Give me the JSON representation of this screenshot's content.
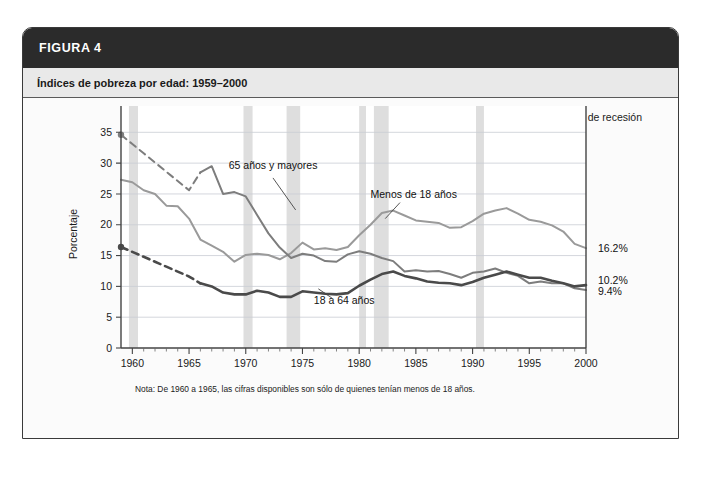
{
  "figure": {
    "header_label": "FIGURA 4",
    "subtitle": "Índices de pobreza por edad: 1959–2000"
  },
  "legend": {
    "recession_label": "Periodo de recesión",
    "swatch_color": "#dedede"
  },
  "note": "Nota: De 1960 a 1965, las cifras disponibles son sólo de quienes tenían menos de 18 años.",
  "end_labels": [
    {
      "name": "menos-de-18",
      "value": "16.2%"
    },
    {
      "name": "18-a-64",
      "value": "10.2%"
    },
    {
      "name": "65-y-mayores",
      "value": "9.4%"
    }
  ],
  "colors": {
    "header_bg": "#2b2b2b",
    "subheader_bg": "#e9e9e9",
    "recession_band": "#dedede",
    "series_menos18": "#9a9a9a",
    "series_18a64": "#4a4a4a",
    "series_65mas": "#7d7d7d",
    "grid": "#c9cdd4"
  },
  "chart_data": {
    "type": "line",
    "title": "Índices de pobreza por edad: 1959–2000",
    "xlabel": "",
    "ylabel": "Porcentaje",
    "xlim": [
      1959,
      2000
    ],
    "ylim": [
      0,
      37
    ],
    "yticks": [
      0,
      5,
      10,
      15,
      20,
      25,
      30,
      35
    ],
    "xticks": [
      1960,
      1965,
      1970,
      1975,
      1980,
      1985,
      1990,
      1995,
      2000
    ],
    "xtick_labels": [
      "1960",
      "1965",
      "1970",
      "1975",
      "1980",
      "1985",
      "1990",
      "1995",
      "2000"
    ],
    "ytick_labels": [
      "0",
      "5",
      "10",
      "15",
      "20",
      "25",
      "30",
      "35"
    ],
    "minor_xtick_step": 1,
    "grid": true,
    "legend_position": "top-right",
    "annotations": [
      {
        "text": "65 años y mayores",
        "x": 1968.5,
        "y": 29.0
      },
      {
        "text": "Menos de 18 años",
        "x": 1981.0,
        "y": 24.4
      },
      {
        "text": "18 a 64 años",
        "x": 1976.0,
        "y": 7.2
      }
    ],
    "recession_bands": [
      {
        "start": 1959.7,
        "end": 1960.5
      },
      {
        "start": 1969.8,
        "end": 1970.6
      },
      {
        "start": 1973.6,
        "end": 1974.8
      },
      {
        "start": 1980.0,
        "end": 1980.6
      },
      {
        "start": 1981.3,
        "end": 1982.6
      },
      {
        "start": 1990.3,
        "end": 1991.0
      }
    ],
    "series": [
      {
        "name": "Menos de 18 años",
        "color": "#9a9a9a",
        "style": "solid",
        "x": [
          1959,
          1960,
          1961,
          1962,
          1963,
          1964,
          1965,
          1966,
          1967,
          1968,
          1969,
          1970,
          1971,
          1972,
          1973,
          1974,
          1975,
          1976,
          1977,
          1978,
          1979,
          1980,
          1981,
          1982,
          1983,
          1984,
          1985,
          1986,
          1987,
          1988,
          1989,
          1990,
          1991,
          1992,
          1993,
          1994,
          1995,
          1996,
          1997,
          1998,
          1999,
          2000
        ],
        "values": [
          27.3,
          26.9,
          25.6,
          25.0,
          23.1,
          23.0,
          21.0,
          17.6,
          16.6,
          15.6,
          14.0,
          15.1,
          15.3,
          15.1,
          14.4,
          15.4,
          17.1,
          16.0,
          16.2,
          15.9,
          16.4,
          18.3,
          20.0,
          21.9,
          22.3,
          21.5,
          20.7,
          20.5,
          20.3,
          19.5,
          19.6,
          20.6,
          21.8,
          22.3,
          22.7,
          21.8,
          20.8,
          20.5,
          19.9,
          18.9,
          16.9,
          16.2
        ]
      },
      {
        "name": "65 años y mayores",
        "color": "#7d7d7d",
        "style": "dashed-then-solid",
        "dashed_until": 1966,
        "x": [
          1959,
          1960,
          1961,
          1962,
          1963,
          1964,
          1965,
          1966,
          1967,
          1968,
          1969,
          1970,
          1971,
          1972,
          1973,
          1974,
          1975,
          1976,
          1977,
          1978,
          1979,
          1980,
          1981,
          1982,
          1983,
          1984,
          1985,
          1986,
          1987,
          1988,
          1989,
          1990,
          1991,
          1992,
          1993,
          1994,
          1995,
          1996,
          1997,
          1998,
          1999,
          2000
        ],
        "values": [
          34.6,
          33.1,
          31.6,
          30.1,
          28.6,
          27.1,
          25.6,
          28.5,
          29.5,
          25.0,
          25.3,
          24.6,
          21.6,
          18.6,
          16.3,
          14.6,
          15.3,
          15.0,
          14.1,
          14.0,
          15.2,
          15.7,
          15.3,
          14.6,
          14.1,
          12.4,
          12.6,
          12.4,
          12.5,
          12.0,
          11.4,
          12.2,
          12.4,
          12.9,
          12.2,
          11.7,
          10.5,
          10.8,
          10.5,
          10.5,
          9.7,
          9.4
        ]
      },
      {
        "name": "18 a 64 años",
        "color": "#4a4a4a",
        "style": "dashed-then-solid",
        "dashed_until": 1966,
        "x": [
          1959,
          1960,
          1961,
          1962,
          1963,
          1964,
          1965,
          1966,
          1967,
          1968,
          1969,
          1970,
          1971,
          1972,
          1973,
          1974,
          1975,
          1976,
          1977,
          1978,
          1979,
          1980,
          1981,
          1982,
          1983,
          1984,
          1985,
          1986,
          1987,
          1988,
          1989,
          1990,
          1991,
          1992,
          1993,
          1994,
          1995,
          1996,
          1997,
          1998,
          1999,
          2000
        ],
        "values": [
          16.4,
          15.6,
          14.8,
          14.0,
          13.2,
          12.4,
          11.6,
          10.5,
          10.0,
          9.0,
          8.7,
          8.7,
          9.3,
          9.0,
          8.3,
          8.3,
          9.2,
          9.0,
          8.8,
          8.7,
          8.9,
          10.1,
          11.1,
          12.0,
          12.4,
          11.7,
          11.3,
          10.8,
          10.6,
          10.5,
          10.2,
          10.7,
          11.4,
          11.9,
          12.4,
          11.9,
          11.4,
          11.4,
          10.9,
          10.5,
          10.0,
          10.2
        ]
      }
    ]
  }
}
